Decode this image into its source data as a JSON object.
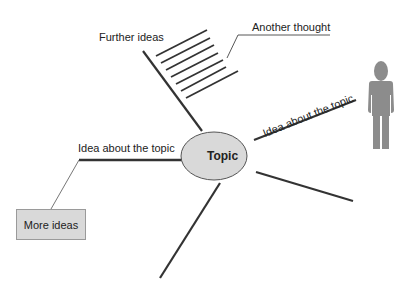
{
  "diagram": {
    "type": "mind-map",
    "central_topic": "Topic",
    "branches": [
      {
        "label": "Further ideas",
        "direction": "upper-left",
        "has_hatching": true
      },
      {
        "label": "Idea about the topic",
        "direction": "right-up",
        "attached_icon": "person-icon"
      },
      {
        "label": "Idea about the topic",
        "direction": "left"
      },
      {
        "label": "",
        "direction": "right-down"
      },
      {
        "label": "",
        "direction": "down"
      }
    ],
    "callouts": [
      {
        "label": "Another thought",
        "points_to": "hatching"
      },
      {
        "label": "More ideas",
        "points_to": "left-branch",
        "boxed": true
      }
    ],
    "colors": {
      "line": "#333333",
      "ellipse_fill": "#d9d9d9",
      "ellipse_stroke": "#555555",
      "box_fill": "#d9d9d9",
      "person": "#8c8c8c"
    }
  }
}
